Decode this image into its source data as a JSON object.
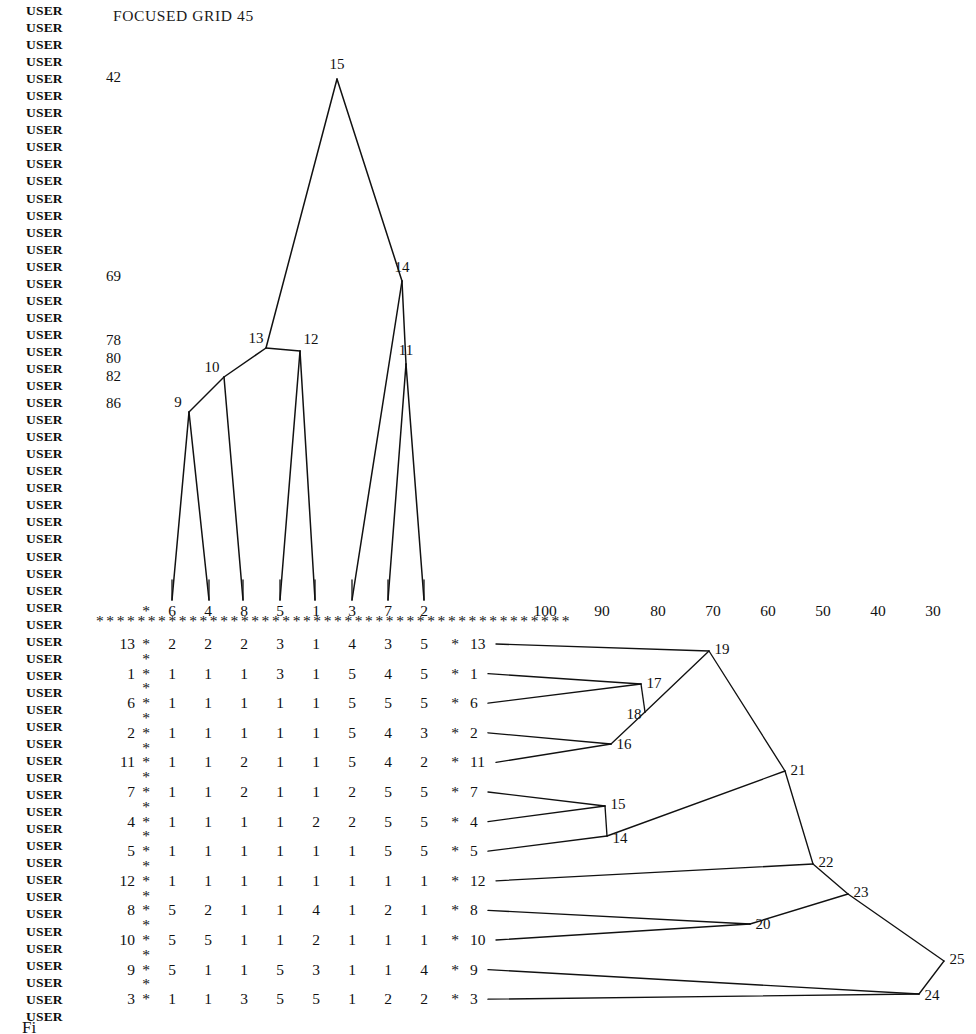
{
  "page": {
    "title": "FOCUSED GRID 45",
    "user_marker": "USER",
    "user_marker_count": 60,
    "figure_caption": "Fi"
  },
  "left_scale": {
    "label_note": "vertical similarity scale values printed at left of top dendrogram",
    "values": [
      "42",
      "69",
      "78",
      "80",
      "82",
      "86"
    ],
    "y": [
      78,
      277,
      341,
      359,
      377,
      404
    ]
  },
  "top_scale": {
    "values": [
      "100",
      "90",
      "80",
      "70",
      "60",
      "50",
      "40",
      "30"
    ],
    "x": [
      545,
      602,
      658,
      713,
      768,
      823,
      878,
      933
    ],
    "y": 611
  },
  "top_dendrogram": {
    "type": "dendrogram",
    "orientation": "vertical",
    "leaves": [
      "6",
      "4",
      "8",
      "5",
      "1",
      "3",
      "7",
      "2"
    ],
    "leaf_x": [
      172,
      209,
      243,
      280,
      315,
      352,
      388,
      424
    ],
    "nodes": [
      {
        "id": "9",
        "x": 189,
        "y": 412,
        "children": [
          "6",
          "4"
        ]
      },
      {
        "id": "10",
        "x": 224,
        "y": 377,
        "children": [
          "9",
          "8"
        ]
      },
      {
        "id": "12",
        "x": 300,
        "y": 351,
        "children": [
          "5",
          "1"
        ]
      },
      {
        "id": "13",
        "x": 266,
        "y": 348,
        "children": [
          "10",
          "12"
        ]
      },
      {
        "id": "11",
        "x": 406,
        "y": 364,
        "children": [
          "7",
          "2"
        ]
      },
      {
        "id": "14",
        "x": 402,
        "y": 281,
        "children": [
          "3",
          "11"
        ]
      },
      {
        "id": "15",
        "x": 337,
        "y": 79,
        "children": [
          "13",
          "14"
        ]
      }
    ]
  },
  "matrix": {
    "column_headers": [
      "6",
      "4",
      "8",
      "5",
      "1",
      "3",
      "7",
      "2"
    ],
    "row_labels": [
      "13",
      "1",
      "6",
      "2",
      "11",
      "7",
      "4",
      "5",
      "12",
      "8",
      "10",
      "9",
      "3"
    ],
    "rows": [
      [
        "2",
        "2",
        "2",
        "3",
        "1",
        "4",
        "3",
        "5"
      ],
      [
        "1",
        "1",
        "1",
        "3",
        "1",
        "5",
        "4",
        "5"
      ],
      [
        "1",
        "1",
        "1",
        "1",
        "1",
        "5",
        "5",
        "5"
      ],
      [
        "1",
        "1",
        "1",
        "1",
        "1",
        "5",
        "4",
        "3"
      ],
      [
        "1",
        "1",
        "2",
        "1",
        "1",
        "5",
        "4",
        "2"
      ],
      [
        "1",
        "1",
        "2",
        "1",
        "1",
        "2",
        "5",
        "5"
      ],
      [
        "1",
        "1",
        "1",
        "1",
        "2",
        "2",
        "5",
        "5"
      ],
      [
        "1",
        "1",
        "1",
        "1",
        "1",
        "1",
        "5",
        "5"
      ],
      [
        "1",
        "1",
        "1",
        "1",
        "1",
        "1",
        "1",
        "1"
      ],
      [
        "5",
        "2",
        "1",
        "1",
        "4",
        "1",
        "2",
        "1"
      ],
      [
        "5",
        "5",
        "1",
        "1",
        "2",
        "1",
        "1",
        "1"
      ],
      [
        "5",
        "1",
        "1",
        "5",
        "3",
        "1",
        "1",
        "4"
      ],
      [
        "1",
        "1",
        "3",
        "5",
        "5",
        "1",
        "2",
        "2"
      ]
    ],
    "star": "*"
  },
  "right_dendrogram": {
    "type": "dendrogram",
    "orientation": "horizontal",
    "leaves": [
      "13",
      "1",
      "6",
      "2",
      "11",
      "7",
      "4",
      "5",
      "12",
      "8",
      "10",
      "9",
      "3"
    ],
    "nodes": [
      {
        "id": "17",
        "x": 641,
        "y": 684,
        "children": [
          "1",
          "6"
        ]
      },
      {
        "id": "16",
        "x": 611,
        "y": 744,
        "children": [
          "2",
          "11"
        ]
      },
      {
        "id": "18",
        "x": 645,
        "y": 712,
        "children": [
          "17",
          "16"
        ]
      },
      {
        "id": "19",
        "x": 709,
        "y": 651,
        "children": [
          "13",
          "18"
        ]
      },
      {
        "id": "15",
        "x": 605,
        "y": 806,
        "children": [
          "7",
          "4"
        ]
      },
      {
        "id": "14",
        "x": 607,
        "y": 836,
        "children": [
          "15",
          "5"
        ]
      },
      {
        "id": "21",
        "x": 785,
        "y": 771,
        "children": [
          "19",
          "14"
        ]
      },
      {
        "id": "20",
        "x": 750,
        "y": 924,
        "children": [
          "8",
          "10"
        ]
      },
      {
        "id": "22",
        "x": 813,
        "y": 864,
        "children": [
          "21",
          "12"
        ]
      },
      {
        "id": "23",
        "x": 848,
        "y": 894,
        "children": [
          "22",
          "20"
        ]
      },
      {
        "id": "24",
        "x": 919,
        "y": 994,
        "children": [
          "9",
          "3"
        ]
      },
      {
        "id": "25",
        "x": 944,
        "y": 961,
        "children": [
          "23",
          "24"
        ]
      }
    ]
  },
  "colors": {
    "ink": "#111111",
    "paper": "#ffffff"
  }
}
